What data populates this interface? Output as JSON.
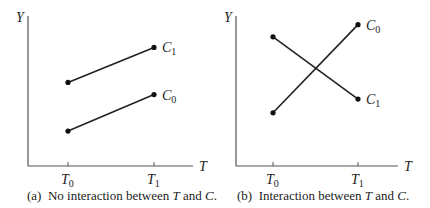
{
  "chart_data": [
    {
      "type": "line",
      "panel": "a",
      "caption": {
        "prefix": "(a)  No interaction between ",
        "var1": "T",
        "mid": " and ",
        "var2": "C",
        "suffix": "."
      },
      "xlabel": "T",
      "ylabel": "Y",
      "categories": [
        {
          "base": "T",
          "sub": "0"
        },
        {
          "base": "T",
          "sub": "1"
        }
      ],
      "series": [
        {
          "name": "C1",
          "base": "C",
          "sub": "1",
          "values": [
            0.55,
            0.78
          ]
        },
        {
          "name": "C0",
          "base": "C",
          "sub": "0",
          "values": [
            0.23,
            0.47
          ]
        }
      ],
      "ylim": [
        0,
        1
      ],
      "grid": false
    },
    {
      "type": "line",
      "panel": "b",
      "caption": {
        "prefix": "(b)  Interaction between ",
        "var1": "T",
        "mid": " and ",
        "var2": "C",
        "suffix": "."
      },
      "xlabel": "T",
      "ylabel": "Y",
      "categories": [
        {
          "base": "T",
          "sub": "0"
        },
        {
          "base": "T",
          "sub": "1"
        }
      ],
      "series": [
        {
          "name": "C0",
          "base": "C",
          "sub": "0",
          "values": [
            0.35,
            0.93
          ]
        },
        {
          "name": "C1",
          "base": "C",
          "sub": "1",
          "values": [
            0.85,
            0.44
          ]
        }
      ],
      "ylim": [
        0,
        1
      ],
      "grid": false
    }
  ]
}
